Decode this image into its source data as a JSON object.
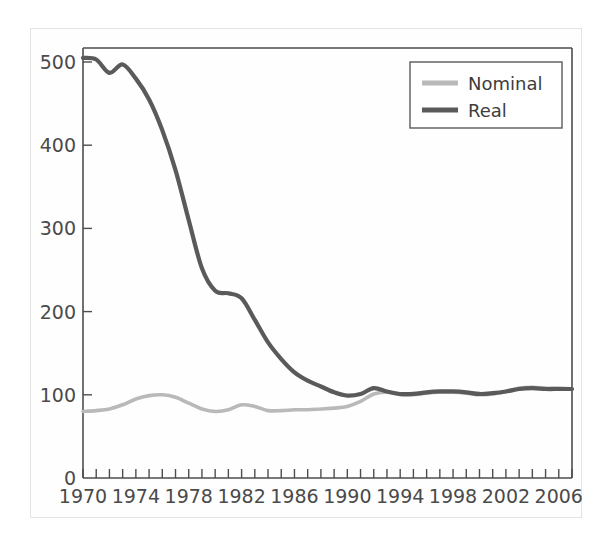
{
  "figure": {
    "background_color": "#ffffff",
    "frame_color": "#e3e3e3",
    "axis_color": "#4d4d4d"
  },
  "legend": {
    "position": "top-right",
    "entries": [
      {
        "label": "Nominal",
        "color": "#b9b9b9"
      },
      {
        "label": "Real",
        "color": "#5a5a5a"
      }
    ]
  },
  "axes": {
    "y_ticks": [
      "0",
      "100",
      "200",
      "300",
      "400",
      "500"
    ],
    "x_ticks": [
      "1970",
      "1974",
      "1978",
      "1982",
      "1986",
      "1990",
      "1994",
      "1998",
      "2002",
      "2006"
    ]
  },
  "chart_data": {
    "type": "line",
    "title": "",
    "xlabel": "",
    "ylabel": "",
    "xlim": [
      1970,
      2007
    ],
    "ylim": [
      0,
      520
    ],
    "yticks": [
      0,
      100,
      200,
      300,
      400,
      500
    ],
    "xticks": [
      1970,
      1974,
      1978,
      1982,
      1986,
      1990,
      1994,
      1998,
      2002,
      2006
    ],
    "grid": false,
    "legend_position": "top-right",
    "x": [
      1970,
      1971,
      1972,
      1973,
      1974,
      1975,
      1976,
      1977,
      1978,
      1979,
      1980,
      1981,
      1982,
      1983,
      1984,
      1985,
      1986,
      1987,
      1988,
      1989,
      1990,
      1991,
      1992,
      1993,
      1994,
      1995,
      1996,
      1997,
      1998,
      1999,
      2000,
      2001,
      2002,
      2003,
      2004,
      2005,
      2006,
      2007
    ],
    "series": [
      {
        "name": "Nominal",
        "color": "#b9b9b9",
        "values": [
          80,
          81,
          83,
          88,
          95,
          99,
          100,
          97,
          90,
          83,
          80,
          82,
          88,
          86,
          81,
          81,
          82,
          82,
          83,
          84,
          86,
          92,
          101,
          103,
          100,
          100,
          102,
          103,
          103,
          102,
          100,
          101,
          104,
          108,
          109,
          108,
          108,
          107
        ]
      },
      {
        "name": "Real",
        "color": "#5a5a5a",
        "values": [
          505,
          503,
          487,
          497,
          480,
          455,
          418,
          370,
          310,
          252,
          225,
          222,
          216,
          190,
          163,
          143,
          127,
          117,
          110,
          103,
          99,
          101,
          108,
          104,
          101,
          101,
          103,
          104,
          104,
          103,
          101,
          102,
          104,
          107,
          108,
          107,
          107,
          107
        ]
      }
    ]
  }
}
